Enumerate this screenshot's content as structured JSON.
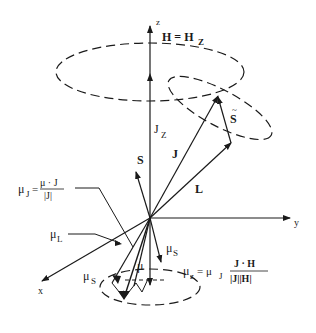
{
  "diagram": {
    "axes": {
      "z": "z",
      "y": "y",
      "x": "x"
    },
    "labels": {
      "field": "H = H",
      "field_sub": "Z",
      "jz": "J",
      "jz_sub": "Z",
      "j": "J",
      "s": "S",
      "s_tilde": "S",
      "l": "L",
      "mu_l": "μ",
      "mu_l_sub": "L",
      "mu_s_upper": "μ",
      "mu_s_upper_sub": "S",
      "mu_s_lower": "μ",
      "mu_s_lower_sub": "S",
      "mu": "μ",
      "mu_j_lhs": "μ",
      "mu_j_sub": "J",
      "mu_j_eq": "=",
      "mu_j_num": "μ · J",
      "mu_j_den": "|J|",
      "mu_z_lhs": "μ",
      "mu_z_sub": "z",
      "mu_z_eq": "= μ",
      "mu_z_eq_sub": "J",
      "mu_z_num": "J · H",
      "mu_z_den": "|J||H|"
    },
    "colors": {
      "ink": "#1a1a1a",
      "background": "#ffffff"
    }
  }
}
